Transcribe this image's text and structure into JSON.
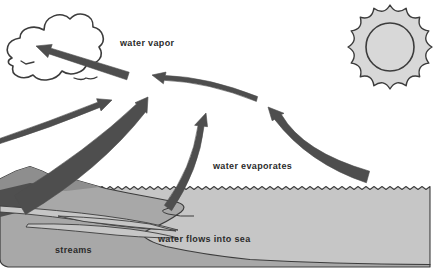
{
  "labels": {
    "water_vapor": "water vapor",
    "water_evaporates": "water evaporates",
    "water_flows_into_sea": "water flows into sea",
    "streams": "streams"
  },
  "colors": {
    "background": "#ffffff",
    "sea": "#c6c6c6",
    "land": "#a8a8a8",
    "mountain": "#8e8e8e",
    "mountain_dark": "#4f4f4f",
    "arrow": "#4e4e4e",
    "sun_fill": "#d8d8d8",
    "cloud_fill": "#ffffff",
    "outline": "#3c3c3c",
    "text": "#2b2b2b"
  }
}
